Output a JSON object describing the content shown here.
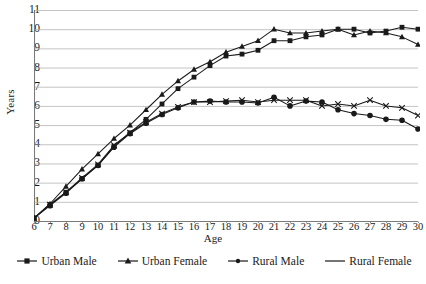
{
  "chart_data": {
    "type": "line",
    "title": "",
    "xlabel": "Age",
    "ylabel": "Years",
    "xlim": [
      6,
      30
    ],
    "ylim": [
      0,
      11
    ],
    "grid": true,
    "legend_position": "bottom",
    "x": [
      6,
      7,
      8,
      9,
      10,
      11,
      12,
      13,
      14,
      15,
      16,
      17,
      18,
      19,
      20,
      21,
      22,
      23,
      24,
      25,
      26,
      27,
      28,
      29,
      30
    ],
    "xticklabels": [
      "6",
      "7",
      "8",
      "9",
      "10",
      "11",
      "12",
      "13",
      "14",
      "15",
      "16",
      "17",
      "18",
      "19",
      "20",
      "21",
      "22",
      "23",
      "24",
      "25",
      "26",
      "27",
      "28",
      "29",
      "30"
    ],
    "yticklabels": [
      "0",
      "1",
      "2",
      "3",
      "4",
      "5",
      "6",
      "7",
      "8",
      "9",
      "10",
      "11"
    ],
    "series": [
      {
        "name": "Urban Male",
        "marker": "square",
        "values": [
          0.15,
          0.85,
          1.5,
          2.2,
          2.9,
          3.9,
          4.6,
          5.3,
          6.1,
          6.9,
          7.5,
          8.1,
          8.6,
          8.7,
          8.9,
          9.4,
          9.4,
          9.6,
          9.7,
          10.0,
          10.0,
          9.8,
          9.9,
          10.1,
          10.0
        ]
      },
      {
        "name": "Urban Female",
        "marker": "triangle",
        "values": [
          0.15,
          0.9,
          1.8,
          2.7,
          3.5,
          4.3,
          5.0,
          5.8,
          6.6,
          7.3,
          7.9,
          8.3,
          8.8,
          9.1,
          9.4,
          10.0,
          9.8,
          9.8,
          9.9,
          10.0,
          9.7,
          9.9,
          9.8,
          9.6,
          9.2
        ]
      },
      {
        "name": "Rural Male",
        "marker": "circle",
        "values": [
          0.15,
          0.8,
          1.45,
          2.2,
          2.9,
          3.85,
          4.55,
          5.1,
          5.55,
          5.9,
          6.2,
          6.25,
          6.2,
          6.2,
          6.15,
          6.45,
          6.0,
          6.25,
          6.2,
          5.8,
          5.6,
          5.5,
          5.3,
          5.25,
          4.8
        ]
      },
      {
        "name": "Rural Female",
        "marker": "cross",
        "values": [
          0.15,
          0.85,
          1.5,
          2.25,
          2.95,
          3.95,
          4.6,
          5.15,
          5.6,
          5.95,
          6.2,
          6.2,
          6.25,
          6.3,
          6.2,
          6.3,
          6.3,
          6.3,
          6.0,
          6.1,
          6.0,
          6.3,
          6.0,
          5.9,
          5.5
        ]
      }
    ]
  },
  "axes": {
    "ylabel": "Years",
    "xlabel": "Age"
  },
  "legend": {
    "items": [
      {
        "label": "Urban Male",
        "marker": "square"
      },
      {
        "label": "Urban Female",
        "marker": "triangle"
      },
      {
        "label": "Rural Male",
        "marker": "circle"
      },
      {
        "label": "Rural Female",
        "marker": "line"
      }
    ]
  },
  "colors": {
    "line": "#1a1a1a",
    "grid": "#b5b5b5",
    "axis": "#808080",
    "background": "#ffffff"
  }
}
